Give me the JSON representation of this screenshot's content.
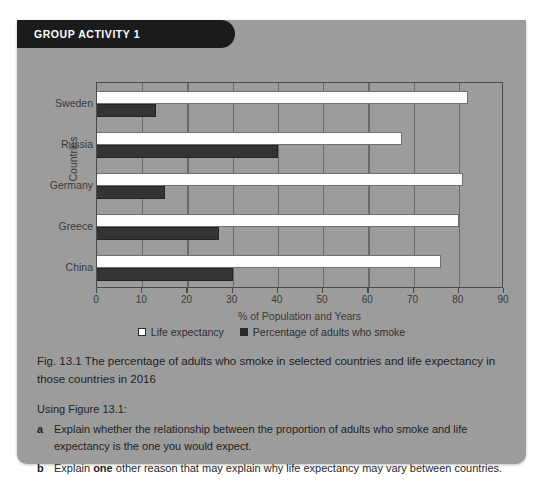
{
  "panel": {
    "header_title": "GROUP ACTIVITY 1"
  },
  "chart_data": {
    "type": "bar",
    "orientation": "horizontal",
    "title": "",
    "xlabel": "% of Population and Years",
    "ylabel": "Countries",
    "categories": [
      "Sweden",
      "Russia",
      "Germany",
      "Greece",
      "China"
    ],
    "xlim": [
      0,
      90
    ],
    "xticks": [
      0,
      10,
      20,
      30,
      40,
      50,
      60,
      70,
      80,
      90
    ],
    "grid": "vertical",
    "legend_position": "bottom-center",
    "series": [
      {
        "name": "Life expectancy",
        "color": "#fdfdfd",
        "values": [
          82,
          67.5,
          81,
          80,
          76
        ]
      },
      {
        "name": "Percentage of adults who smoke",
        "color": "#343434",
        "values": [
          13,
          40,
          15,
          27,
          30
        ]
      }
    ]
  },
  "caption": "Fig. 13.1 The percentage of adults who smoke in selected countries and life expectancy in those countries in 2016",
  "questions": {
    "intro": "Using Figure 13.1:",
    "items": [
      {
        "marker": "a",
        "text_before": "Explain whether the relationship between the proportion of adults who smoke and life expectancy is the one you would expect.",
        "bold": "",
        "text_after": ""
      },
      {
        "marker": "b",
        "text_before": "Explain ",
        "bold": "one",
        "text_after": " other reason that may explain why life expectancy may vary between countries."
      }
    ]
  }
}
